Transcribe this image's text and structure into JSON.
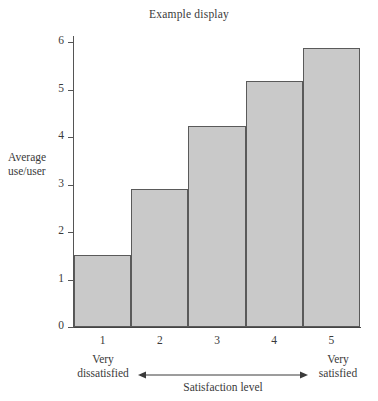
{
  "chart_data": {
    "type": "bar",
    "title": "Example display",
    "xlabel": "Satisfaction level",
    "ylabel": "Average use/user",
    "categories": [
      "1",
      "2",
      "3",
      "4",
      "5"
    ],
    "values": [
      1.52,
      2.9,
      4.23,
      5.17,
      5.87
    ],
    "ylim": [
      0,
      6
    ],
    "yticks": [
      "0",
      "1",
      "2",
      "3",
      "4",
      "5",
      "6"
    ],
    "ytick_values": [
      0,
      1,
      2,
      3,
      4,
      5,
      6
    ],
    "xlim_labels": {
      "low": [
        "Very",
        "dissatisfied"
      ],
      "high": [
        "Very",
        "satisfied"
      ]
    },
    "grid": false,
    "legend": false,
    "bar_fill_color": "#c9c9c9",
    "bar_edge_color": "#5a5a5a",
    "axis_color": "#555555",
    "text_color": "#3a3a3a",
    "background_color": "#ffffff"
  },
  "labels": {
    "y_axis_line1": "Average",
    "y_axis_line2": "use/user",
    "anchor_low_line1": "Very",
    "anchor_low_line2": "dissatisfied",
    "anchor_high_line1": "Very",
    "anchor_high_line2": "satisfied"
  }
}
